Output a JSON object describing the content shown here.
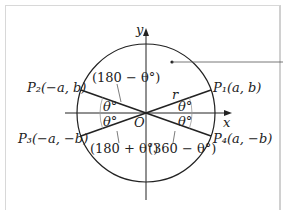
{
  "diagram": {
    "axes": {
      "x_label": "x",
      "y_label": "y",
      "origin_label": "O"
    },
    "radius_label": "r",
    "points": [
      {
        "name": "P1",
        "label": "P₁(a, b)",
        "quadrant": 1
      },
      {
        "name": "P2",
        "label": "P₂(−a, b)",
        "quadrant": 2
      },
      {
        "name": "P3",
        "label": "P₃(−a, −b)",
        "quadrant": 3
      },
      {
        "name": "P4",
        "label": "P₄(a, −b)",
        "quadrant": 4
      }
    ],
    "angle_labels": {
      "q1": "θ°",
      "q2": "θ°",
      "q3": "θ°",
      "q4": "θ°"
    },
    "reference_angles": {
      "q2": "(180 − θ°)",
      "q3": "(180 + θ°)",
      "q4": "(360 − θ°)"
    },
    "colors": {
      "line": "#222222",
      "arc": "#999999",
      "frame": "#d8d8d8"
    }
  }
}
